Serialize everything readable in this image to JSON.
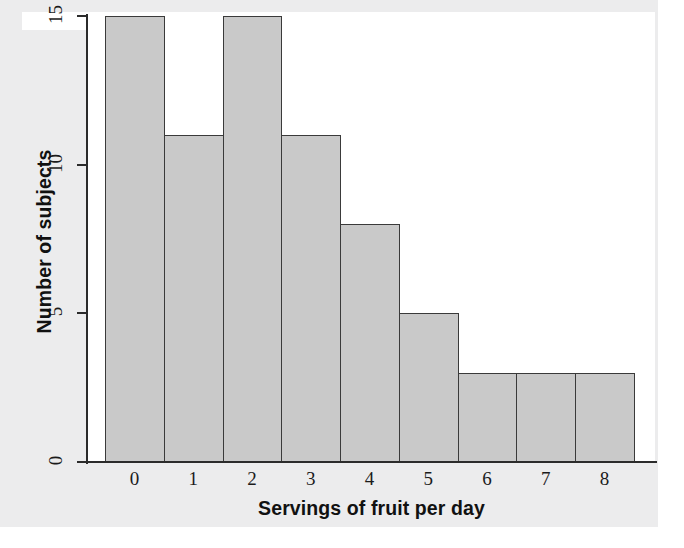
{
  "figure": {
    "background_color": "#ececed",
    "plot_background_color": "#ffffff",
    "bar_fill_color": "#c9c9c9",
    "bar_edge_color": "#3a3a3a",
    "axis_color": "#2b2b2b"
  },
  "chart_data": {
    "type": "bar",
    "title": "",
    "subtitle": "",
    "xlabel": "Servings of fruit per day",
    "ylabel": "Number of subjects",
    "categories": [
      "0",
      "1",
      "2",
      "3",
      "4",
      "5",
      "6",
      "7",
      "8"
    ],
    "values": [
      15,
      11,
      15,
      11,
      8,
      5,
      3,
      3,
      3
    ],
    "series": [
      {
        "name": "Number of subjects",
        "values": [
          15,
          11,
          15,
          11,
          8,
          5,
          3,
          3,
          3
        ]
      }
    ],
    "x_tick_labels": [
      "0",
      "1",
      "2",
      "3",
      "4",
      "5",
      "6",
      "7",
      "8"
    ],
    "y_tick_labels": [
      "0",
      "5",
      "10",
      "15"
    ],
    "y_tick_values": [
      0,
      5,
      10,
      15
    ],
    "ylim": [
      0,
      15
    ],
    "xlim": [
      -0.5,
      8.5
    ],
    "grid": false,
    "legend": false,
    "legend_position": "none",
    "bar_gap": 0,
    "annotations": []
  }
}
